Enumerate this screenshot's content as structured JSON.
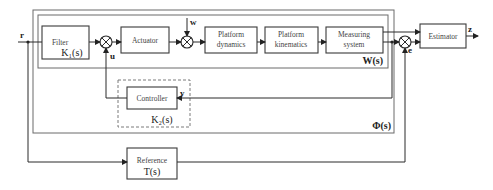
{
  "blocks": {
    "filter": {
      "label": "Filter",
      "tf": "K₁(s)"
    },
    "actuator": {
      "label": "Actuator"
    },
    "platform_dynamics": {
      "label1": "Platform",
      "label2": "dynamics"
    },
    "platform_kinematics": {
      "label1": "Platform",
      "label2": "kinematics"
    },
    "measuring_system": {
      "label1": "Measuring",
      "label2": "system"
    },
    "estimator": {
      "label": "Estimator"
    },
    "controller": {
      "label": "Controller",
      "tf": "K₂(s)"
    },
    "reference": {
      "label": "Reference",
      "tf": "T(s)"
    }
  },
  "frames": {
    "inner_tf": "W(s)",
    "outer_tf": "Φ(s)"
  },
  "signals": {
    "r": "r",
    "u": "u",
    "w": "w",
    "y": "y",
    "e": "e",
    "z": "z"
  }
}
